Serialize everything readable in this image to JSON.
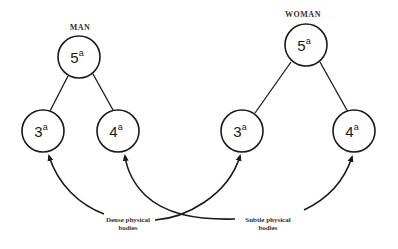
{
  "diagram": {
    "groups": [
      {
        "label": "MAN",
        "nodes": [
          {
            "id": "man-5",
            "number": "5",
            "superscript": "a",
            "role": "top"
          },
          {
            "id": "man-3",
            "number": "3",
            "superscript": "a",
            "role": "left"
          },
          {
            "id": "man-4",
            "number": "4",
            "superscript": "a",
            "role": "right"
          }
        ]
      },
      {
        "label": "WOMAN",
        "nodes": [
          {
            "id": "woman-5",
            "number": "5",
            "superscript": "a",
            "role": "top"
          },
          {
            "id": "woman-3",
            "number": "3",
            "superscript": "a",
            "role": "left"
          },
          {
            "id": "woman-4",
            "number": "4",
            "superscript": "a",
            "role": "right"
          }
        ]
      }
    ],
    "captions": {
      "dense": {
        "line1": "Dense physical",
        "line2": "bodies",
        "points_to": [
          "man-3",
          "woman-3"
        ]
      },
      "subtle": {
        "line1": "Subtle physical",
        "line2": "bodies",
        "points_to": [
          "man-4",
          "woman-4"
        ]
      }
    }
  }
}
